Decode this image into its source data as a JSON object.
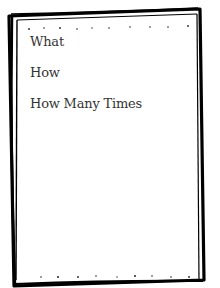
{
  "card": {
    "lines": [
      "What",
      "How",
      "How Many Times"
    ],
    "text_color": "#333333",
    "border_color": "#000000",
    "background": "#ffffff"
  }
}
